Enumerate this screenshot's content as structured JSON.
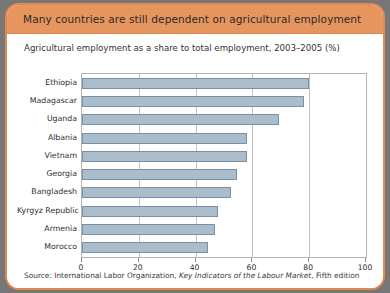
{
  "figure": {
    "title": "Many countries are still dependent on agricultural employment",
    "subtitle": "Agricultural employment as a share to total employment, 2003–2005 (%)",
    "source_prefix": "Source: International Labor Organization, ",
    "source_italic": "Key Indicators of the Labour Market",
    "source_suffix": ", Fifth edition"
  },
  "colors": {
    "frame": "#e08a50",
    "title_band": "#e6955e",
    "bar_fill": "#aabdcd",
    "bar_stroke": "#7c8fa3",
    "gridline": "#c2c2c2",
    "plot_border": "#b4b4b4",
    "page_background": "#777777",
    "panel_background": "#ffffff"
  },
  "chart_data": {
    "type": "bar",
    "orientation": "horizontal",
    "title": "Many countries are still dependent on agricultural employment",
    "subtitle": "Agricultural employment as a share to total employment, 2003–2005 (%)",
    "xlabel": "",
    "ylabel": "",
    "xlim": [
      0,
      100
    ],
    "xticks": [
      0,
      20,
      40,
      60,
      80,
      100
    ],
    "xtick_labels": [
      "0",
      "20",
      "40",
      "60",
      "80",
      "100"
    ],
    "grid": "vertical",
    "legend": "none",
    "categories": [
      "Ethiopia",
      "Madagascar",
      "Uganda",
      "Albania",
      "Vietnam",
      "Georgia",
      "Bangladesh",
      "Kyrgyz Republic",
      "Armenia",
      "Morocco"
    ],
    "values": [
      80,
      78,
      69.5,
      58,
      58,
      54.5,
      52.5,
      48,
      47,
      44.5
    ],
    "units": "%",
    "source": "Source: International Labor Organization, Key Indicators of the Labour Market, Fifth edition"
  }
}
